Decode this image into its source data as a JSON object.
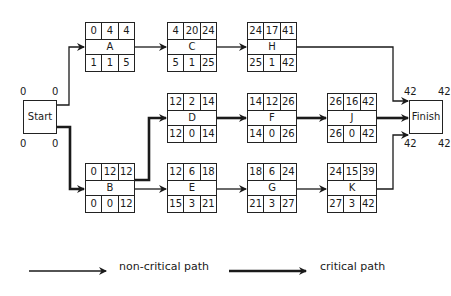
{
  "diagram": {
    "type": "critical-path-network",
    "start": {
      "label": "Start",
      "top_left": "0",
      "top_right": "0",
      "bottom_left": "0",
      "bottom_right": "0"
    },
    "finish": {
      "label": "Finish",
      "top_left": "42",
      "top_right": "42",
      "bottom_left": "42",
      "bottom_right": "42"
    },
    "nodes": {
      "A": {
        "name": "A",
        "es": "0",
        "dur": "4",
        "ef": "4",
        "ls": "1",
        "slack": "1",
        "lf": "5"
      },
      "B": {
        "name": "B",
        "es": "0",
        "dur": "12",
        "ef": "12",
        "ls": "0",
        "slack": "0",
        "lf": "12"
      },
      "C": {
        "name": "C",
        "es": "4",
        "dur": "20",
        "ef": "24",
        "ls": "5",
        "slack": "1",
        "lf": "25"
      },
      "D": {
        "name": "D",
        "es": "12",
        "dur": "2",
        "ef": "14",
        "ls": "12",
        "slack": "0",
        "lf": "14"
      },
      "E": {
        "name": "E",
        "es": "12",
        "dur": "6",
        "ef": "18",
        "ls": "15",
        "slack": "3",
        "lf": "21"
      },
      "F": {
        "name": "F",
        "es": "14",
        "dur": "12",
        "ef": "26",
        "ls": "14",
        "slack": "0",
        "lf": "26"
      },
      "G": {
        "name": "G",
        "es": "18",
        "dur": "6",
        "ef": "24",
        "ls": "21",
        "slack": "3",
        "lf": "27"
      },
      "H": {
        "name": "H",
        "es": "24",
        "dur": "17",
        "ef": "41",
        "ls": "25",
        "slack": "1",
        "lf": "42"
      },
      "J": {
        "name": "J",
        "es": "26",
        "dur": "16",
        "ef": "42",
        "ls": "26",
        "slack": "0",
        "lf": "42"
      },
      "K": {
        "name": "K",
        "es": "24",
        "dur": "15",
        "ef": "39",
        "ls": "27",
        "slack": "3",
        "lf": "42"
      }
    },
    "edges": [
      {
        "from": "Start",
        "to": "A",
        "critical": false
      },
      {
        "from": "Start",
        "to": "B",
        "critical": true
      },
      {
        "from": "A",
        "to": "C",
        "critical": false
      },
      {
        "from": "C",
        "to": "H",
        "critical": false
      },
      {
        "from": "H",
        "to": "Finish",
        "critical": false
      },
      {
        "from": "B",
        "to": "D",
        "critical": true
      },
      {
        "from": "B",
        "to": "E",
        "critical": false
      },
      {
        "from": "D",
        "to": "F",
        "critical": true
      },
      {
        "from": "F",
        "to": "J",
        "critical": true
      },
      {
        "from": "J",
        "to": "Finish",
        "critical": true
      },
      {
        "from": "E",
        "to": "G",
        "critical": false
      },
      {
        "from": "G",
        "to": "K",
        "critical": false
      },
      {
        "from": "K",
        "to": "Finish",
        "critical": false
      }
    ]
  },
  "legend": {
    "non_critical": "non-critical path",
    "critical": "critical path"
  },
  "colors": {
    "line": "#1a1a1a",
    "background": "#ffffff"
  }
}
